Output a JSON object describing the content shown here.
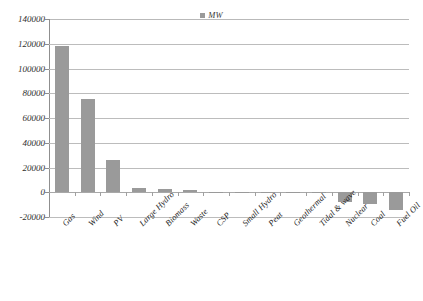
{
  "chart_data": {
    "type": "bar",
    "title": "",
    "subtitle": "",
    "xlabel": "",
    "ylabel": "",
    "legend": {
      "position": "top-center",
      "entries": [
        {
          "name": "MW",
          "color": "#9a9a9a",
          "marker": "square"
        }
      ]
    },
    "series": [
      {
        "name": "MW",
        "color": "#9a9a9a",
        "values": [
          118000,
          75000,
          26000,
          3200,
          3000,
          1800,
          400,
          300,
          200,
          150,
          100,
          -8000,
          -9500,
          -14000
        ]
      }
    ],
    "categories": [
      "Gas",
      "Wind",
      "PV",
      "Large Hydro",
      "Biomass",
      "Waste",
      "CSP",
      "Small Hydro",
      "Peat",
      "Geothermal",
      "Tidal & wave",
      "Nuclear",
      "Coal",
      "Fuel Oil"
    ],
    "ylim": [
      -20000,
      140000
    ],
    "ytick_step": 20000,
    "yticks": [
      -20000,
      0,
      20000,
      40000,
      60000,
      80000,
      100000,
      120000,
      140000
    ],
    "ytick_labels": [
      "-20000",
      "0",
      "20000",
      "40000",
      "60000",
      "80000",
      "100000",
      "120000",
      "140000"
    ],
    "grid": {
      "horizontal": true,
      "vertical": false,
      "color": "#bcbcbc"
    },
    "axis": {
      "y_line_color": "#8f8f8f",
      "zero_line_color": "#a8a8a8"
    },
    "xlabel_rotation_degrees": -45,
    "annotations": []
  }
}
